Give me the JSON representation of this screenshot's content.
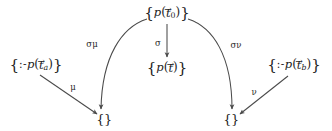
{
  "figure": {
    "type": "commutative-diagram",
    "width": 332,
    "height": 131,
    "background_color": "#ffffff",
    "stroke_color": "#4a4a4a",
    "text_color": "#1c1c1c"
  },
  "nodes": {
    "top": {
      "id": "node-top",
      "text": "{p(t⃗0)}",
      "open_brace": "{",
      "close_brace": "}",
      "predicate": "p",
      "lparen": "(",
      "rparen": ")",
      "term": "t",
      "vector_accent": "→",
      "subscript": "0",
      "x": 167,
      "y": 13
    },
    "middle": {
      "id": "node-middle",
      "text": "{p(t⃗)}",
      "open_brace": "{",
      "close_brace": "}",
      "predicate": "p",
      "lparen": "(",
      "rparen": ")",
      "term": "t",
      "vector_accent": "→",
      "subscript": "",
      "x": 167,
      "y": 68
    },
    "left": {
      "id": "node-left",
      "text": "{:- p(t⃗a)}",
      "open_brace": "{",
      "close_brace": "}",
      "neck": ":-",
      "predicate": "p",
      "lparen": "(",
      "rparen": ")",
      "term": "t",
      "vector_accent": "→",
      "subscript": "a",
      "x": 36,
      "y": 65
    },
    "right": {
      "id": "node-right",
      "text": "{:- p(t⃗b)}",
      "open_brace": "{",
      "close_brace": "}",
      "neck": ":-",
      "predicate": "p",
      "lparen": "(",
      "rparen": ")",
      "term": "t",
      "vector_accent": "→",
      "subscript": "b",
      "x": 294,
      "y": 65
    },
    "bottom_left": {
      "id": "node-bottom-left",
      "text": "{}",
      "x": 104,
      "y": 119
    },
    "bottom_right": {
      "id": "node-bottom-right",
      "text": "{}",
      "x": 231,
      "y": 119
    }
  },
  "edges": [
    {
      "id": "edge-sigma-mu",
      "label": "σμ",
      "from": "top",
      "to": "bottom_left",
      "shape": "curve",
      "label_x": 92,
      "label_y": 44
    },
    {
      "id": "edge-sigma",
      "label": "σ",
      "from": "top",
      "to": "middle",
      "shape": "straight-vertical",
      "label_x": 158,
      "label_y": 43
    },
    {
      "id": "edge-sigma-nu",
      "label": "σν",
      "from": "top",
      "to": "bottom_right",
      "shape": "curve",
      "label_x": 236,
      "label_y": 45
    },
    {
      "id": "edge-mu",
      "label": "μ",
      "from": "left",
      "to": "bottom_left",
      "shape": "straight-diagonal",
      "label_x": 73,
      "label_y": 87
    },
    {
      "id": "edge-nu",
      "label": "ν",
      "from": "right",
      "to": "bottom_right",
      "shape": "straight-diagonal",
      "label_x": 254,
      "label_y": 92
    }
  ]
}
